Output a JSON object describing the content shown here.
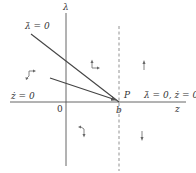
{
  "diagram": {
    "type": "phase-diagram",
    "axes": {
      "vertical_label": "λ",
      "horizontal_label": "z",
      "origin_label": "0"
    },
    "point": {
      "label": "P",
      "x_label": "b"
    },
    "curves": {
      "lambda_dot_zero": "λ̇ = 0",
      "z_dot_zero": "ż = 0",
      "both_zero": "λ̇ = 0, ż = 0"
    },
    "flow_arrows": [
      {
        "region": "upper-left",
        "direction": "left-down"
      },
      {
        "region": "upper-middle",
        "direction": "up-right"
      },
      {
        "region": "upper-right",
        "direction": "up"
      },
      {
        "region": "lower-middle",
        "direction": "left-down"
      },
      {
        "region": "lower-right",
        "direction": "down"
      }
    ],
    "colors": {
      "line": "#444444",
      "text": "#333333",
      "background": "#ffffff"
    }
  }
}
